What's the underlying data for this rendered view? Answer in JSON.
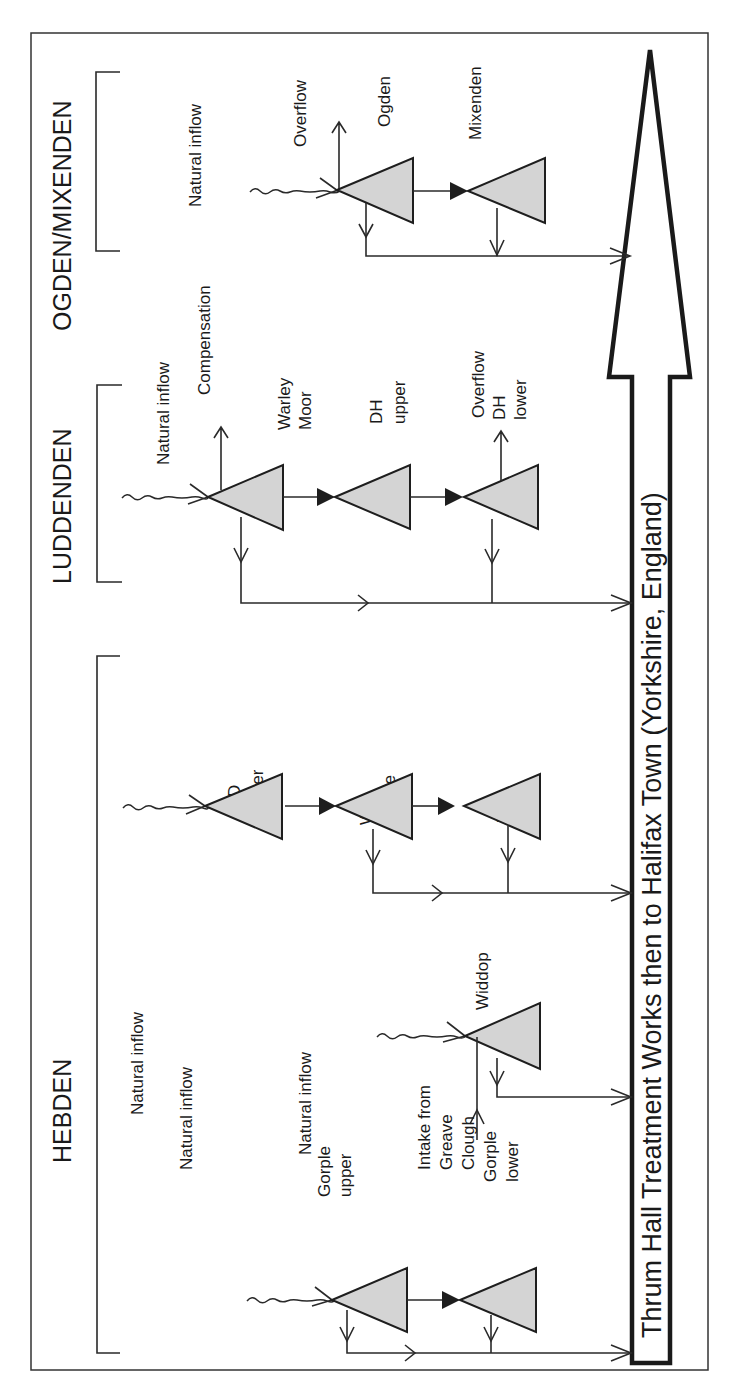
{
  "diagram": {
    "orientation": "rotated -90deg (text reads bottom-to-top)",
    "main_arrow_label": "Thrum Hall Treatment Works then to Halifax Town (Yorkshire, England)",
    "colors": {
      "reservoir_fill": "#d4d4d4",
      "line": "#2a2a2a",
      "background": "#ffffff"
    },
    "groups": [
      {
        "name": "OGDEN/MIXENDEN",
        "labels": {
          "natural_inflow": "Natural inflow",
          "overflow": "Overflow"
        },
        "reservoirs": [
          {
            "name": "Ogden"
          },
          {
            "name": "Mixenden"
          }
        ]
      },
      {
        "name": "LUDDENDEN",
        "labels": {
          "natural_inflow": "Natural inflow",
          "compensation": "Compensation",
          "overflow": "Overflow"
        },
        "reservoirs": [
          {
            "name_line1": "Warley",
            "name_line2": "Moor"
          },
          {
            "name_line1": "DH",
            "name_line2": "upper"
          },
          {
            "name_line1": "DH",
            "name_line2": "lower"
          }
        ]
      },
      {
        "name": "HEBDEN",
        "labels": {
          "wd_natural_inflow": "Natural inflow",
          "widdop_natural_inflow": "Natural inflow",
          "gorple_natural_inflow": "Natural inflow",
          "intake_line1": "Intake from",
          "intake_line2": "Greave",
          "intake_line3": "Clough"
        },
        "reservoirs": [
          {
            "name_line1": "WD",
            "name_line2": "upper"
          },
          {
            "name_line1": "WD",
            "name_line2": "middle"
          },
          {
            "name_line1": "WD",
            "name_line2": "lower"
          },
          {
            "name": "Widdop"
          },
          {
            "name_line1": "Gorple",
            "name_line2": "upper"
          },
          {
            "name_line1": "Gorple",
            "name_line2": "lower"
          }
        ]
      }
    ]
  }
}
